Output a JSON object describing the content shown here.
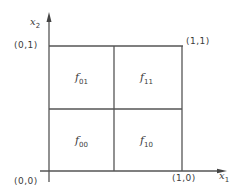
{
  "diagram": {
    "axes": {
      "vertical": {
        "name": "x",
        "sub": "2"
      },
      "horizontal": {
        "name": "x",
        "sub": "1"
      }
    },
    "corners": {
      "origin": "(0,0)",
      "top_left": "(0,1)",
      "top_right": "(1,1)",
      "bottom_right": "(1,0)"
    },
    "cells": [
      {
        "name": "f",
        "sub": "01",
        "position": "top-left"
      },
      {
        "name": "f",
        "sub": "11",
        "position": "top-right"
      },
      {
        "name": "f",
        "sub": "00",
        "position": "bottom-left"
      },
      {
        "name": "f",
        "sub": "10",
        "position": "bottom-right"
      }
    ],
    "line_color": "#555555"
  }
}
